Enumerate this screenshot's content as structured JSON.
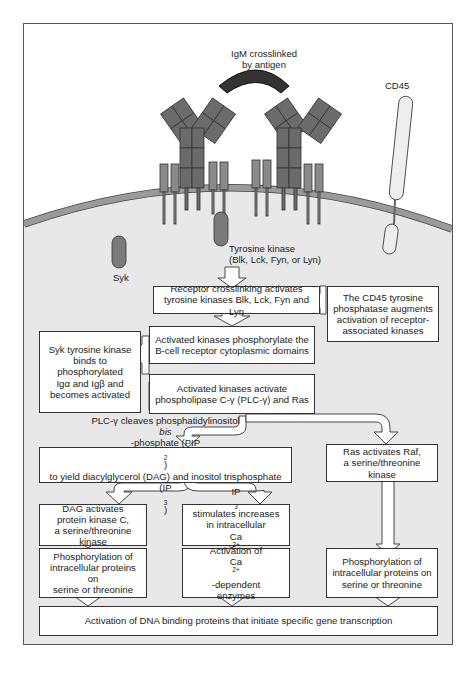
{
  "figure": {
    "colors": {
      "background": "#ffffff",
      "cytoplasm": "#e8e8e8",
      "membrane": "#9a9a9a",
      "igm_chain": "#6b6b6b",
      "antigen": "#333333",
      "ig_alpha_beta": "#8a8a8a",
      "kinase": "#7a7a7a",
      "cd45": "#eeeeee",
      "box_fill": "#ffffff",
      "box_border": "#333333"
    }
  },
  "labels": {
    "igm": [
      "IgM crosslinked",
      "by antigen"
    ],
    "cd45": "CD45",
    "syk": "Syk",
    "tyrosine_kinase": [
      "Tyrosine kinase",
      "(Blk, Lck, Fyn, or Lyn)"
    ]
  },
  "boxes": {
    "receptor_crosslinking": [
      "Receptor crosslinking activates",
      "tyrosine kinases Blk, Lck, Fyn and Lyn"
    ],
    "cd45_phosphatase": [
      "The CD45 tyrosine",
      "phosphatase augments",
      "activation of receptor-",
      "associated kinases"
    ],
    "phosphorylate_domains": [
      "Activated kinases phosphorylate the",
      "B-cell receptor cytoplasmic domains"
    ],
    "syk_binds": [
      "Syk tyrosine kinase",
      "binds to phosphorylated",
      "Igα and Igβ and",
      "becomes activated"
    ],
    "activate_plc": [
      "Activated kinases activate",
      "phospholipase C-γ (PLC-γ) and Ras"
    ],
    "plc_cleaves": {
      "line1_a": "PLC-γ cleaves phosphatidylinositol ",
      "line1_italic": "bis",
      "line1_b": "-phosphate (PIP",
      "line1_sub": "2",
      "line1_c": ")",
      "line2_a": "to yield diacylglycerol (DAG) and inositol trisphosphate (IP",
      "line2_sub": "3",
      "line2_c": ")"
    },
    "ras_raf": [
      "Ras activates Raf,",
      "a serine/threonine kinase"
    ],
    "dag_pkc": [
      "DAG activates",
      "protein kinase C,",
      "a serine/threonine kinase"
    ],
    "ip3_calcium": {
      "line1_a": "IP",
      "line1_sub": "3",
      "line1_b": " stimulates increases",
      "line2": "in intracellular",
      "line3_a": "Ca",
      "line3_sup": "2+",
      "line3_b": " concentration"
    },
    "phospho_left": [
      "Phosphorylation of",
      "intracellular proteins on",
      "serine or threonine"
    ],
    "ca_enzymes": {
      "line1": "Activation of",
      "line2_a": "Ca",
      "line2_sup": "2+",
      "line2_b": "-dependent",
      "line3": "enzymes"
    },
    "phospho_right": [
      "Phosphorylation of",
      "intracellular proteins on",
      "serine or threonine"
    ],
    "dna_binding": "Activation of DNA binding proteins that initiate specific gene transcription"
  }
}
